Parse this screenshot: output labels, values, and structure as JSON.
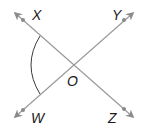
{
  "diagram": {
    "type": "intersecting-lines",
    "colors": {
      "line": "#9a9a9a",
      "arrow": "#8a8a8a",
      "arc": "#3a3a3a",
      "label": "#1a1a1a",
      "background": "#ffffff"
    },
    "points": {
      "X": {
        "label": "X"
      },
      "Y": {
        "label": "Y"
      },
      "O": {
        "label": "O"
      },
      "W": {
        "label": "W"
      },
      "Z": {
        "label": "Z"
      }
    },
    "lines": [
      {
        "name": "XZ",
        "from": "X",
        "to": "Z",
        "arrows": "both"
      },
      {
        "name": "WY",
        "from": "W",
        "to": "Y",
        "arrows": "both"
      }
    ],
    "angle_mark": {
      "angle": "XOW",
      "vertex": "O"
    }
  }
}
